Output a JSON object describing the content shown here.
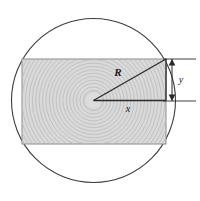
{
  "figure": {
    "type": "geometry-diagram",
    "canvas": {
      "width": 200,
      "height": 201,
      "background": "#ffffff"
    },
    "colors": {
      "outline": "#3d3d3d",
      "rectangle_fill": "#d9d9d9",
      "ring_stroke": "#bdbdbd",
      "core_fill": "#dcdcdc",
      "label_color": "#1a1a1a",
      "dimension_line": "#2b2b2b"
    },
    "circle": {
      "name": "log-cross-section",
      "center_x": 93.5,
      "center_y": 100.5,
      "radius": 82,
      "stroke_width": 1.1,
      "fill": "none"
    },
    "rectangle": {
      "name": "inscribed-beam-section",
      "left": 22,
      "top": 59,
      "right": 166,
      "bottom": 144,
      "width": 144,
      "height": 85,
      "stroke_width": 1.0
    },
    "growth_rings": {
      "name": "concentric-growth-rings",
      "center_x": 93.5,
      "center_y": 100.5,
      "spacing": 3.4,
      "count": 26,
      "stroke_width": 0.85,
      "core_radius": 9
    },
    "triangle": {
      "name": "radius-right-triangle",
      "vertex_center": [
        93.5,
        100.5
      ],
      "vertex_corner": [
        166,
        59
      ],
      "vertex_right_angle": [
        166,
        100.5
      ],
      "stroke_width": 1.3
    },
    "labels": [
      {
        "id": "R",
        "text": "R",
        "x": 118,
        "y": 76,
        "role": "hypotenuse-radius"
      },
      {
        "id": "x",
        "text": "x",
        "x": 128,
        "y": 112,
        "role": "horizontal-half-width"
      },
      {
        "id": "y",
        "text": "y",
        "x": 181,
        "y": 83,
        "role": "vertical-half-height"
      }
    ],
    "dimension_y": {
      "name": "y-dimension",
      "line_x": 172,
      "top_y": 59,
      "bottom_y": 101,
      "extension_top_y": 59,
      "extension_bottom_y": 101,
      "extension_left_x": 163,
      "extension_right_x": 196,
      "arrow_size": 3.4,
      "stroke_width": 1.0
    }
  }
}
